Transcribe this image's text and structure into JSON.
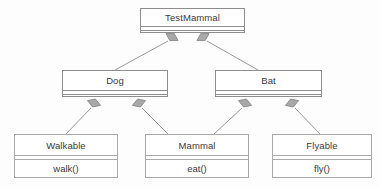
{
  "diagram": {
    "type": "uml-class-diagram",
    "background_color": "#fdfdfd",
    "line_color": "#9a9a9a",
    "border_color": "#8d8d8d",
    "text_color": "#3a3a3a",
    "diamond_fill": "#a8a8a8",
    "diamond_stroke": "#8a8a8a"
  },
  "classes": [
    {
      "id": "testmammal",
      "name": "TestMammal",
      "members": [],
      "x": 140,
      "y": 8,
      "width": 105,
      "height": 25,
      "name_height": 17,
      "has_empty_compartment": true,
      "style": "dark"
    },
    {
      "id": "dog",
      "name": "Dog",
      "members": [],
      "x": 62,
      "y": 70,
      "width": 106,
      "height": 27,
      "name_height": 19,
      "has_empty_compartment": true,
      "style": "dark"
    },
    {
      "id": "bat",
      "name": "Bat",
      "members": [],
      "x": 215,
      "y": 70,
      "width": 107,
      "height": 27,
      "name_height": 19,
      "has_empty_compartment": true,
      "style": "dark"
    },
    {
      "id": "walkable",
      "name": "Walkable",
      "members": [
        "walk()"
      ],
      "x": 14,
      "y": 134,
      "width": 104,
      "height": 44,
      "name_height": 20,
      "has_empty_compartment": false,
      "style": "light"
    },
    {
      "id": "mammal",
      "name": "Mammal",
      "members": [
        "eat()"
      ],
      "x": 145,
      "y": 134,
      "width": 104,
      "height": 44,
      "name_height": 20,
      "has_empty_compartment": false,
      "style": "light"
    },
    {
      "id": "flyable",
      "name": "Flyable",
      "members": [
        "fly()"
      ],
      "x": 272,
      "y": 134,
      "width": 100,
      "height": 44,
      "name_height": 20,
      "has_empty_compartment": false,
      "style": "light"
    },
    {
      "id": "testmammal-shadow",
      "name": "",
      "members": [],
      "x": 0,
      "y": 0,
      "width": 0,
      "height": 0,
      "name_height": 0,
      "has_empty_compartment": false,
      "style": "hidden"
    }
  ],
  "relationships": [
    {
      "id": "testmammal-dog",
      "type": "aggregation",
      "from": "TestMammal",
      "to": "Dog",
      "diamond": {
        "cx": 172,
        "cy": 37,
        "angle": 210
      },
      "line": {
        "x1": 168,
        "y1": 41,
        "x2": 115,
        "y2": 70
      }
    },
    {
      "id": "testmammal-bat",
      "type": "aggregation",
      "from": "TestMammal",
      "to": "Bat",
      "diamond": {
        "cx": 203,
        "cy": 37,
        "angle": 330
      },
      "line": {
        "x1": 207,
        "y1": 41,
        "x2": 258,
        "y2": 70
      }
    },
    {
      "id": "dog-walkable",
      "type": "aggregation",
      "from": "Dog",
      "to": "Walkable",
      "diamond": {
        "cx": 94,
        "cy": 103,
        "angle": 200
      },
      "line": {
        "x1": 91,
        "y1": 108,
        "x2": 66,
        "y2": 134
      }
    },
    {
      "id": "dog-mammal",
      "type": "aggregation",
      "from": "Dog",
      "to": "Mammal",
      "diamond": {
        "cx": 139,
        "cy": 103,
        "angle": 340
      },
      "line": {
        "x1": 142,
        "y1": 108,
        "x2": 168,
        "y2": 134
      }
    },
    {
      "id": "bat-mammal",
      "type": "aggregation",
      "from": "Bat",
      "to": "Mammal",
      "diamond": {
        "cx": 245,
        "cy": 103,
        "angle": 200
      },
      "line": {
        "x1": 242,
        "y1": 108,
        "x2": 214,
        "y2": 134
      }
    },
    {
      "id": "bat-flyable",
      "type": "aggregation",
      "from": "Bat",
      "to": "Flyable",
      "diamond": {
        "cx": 292,
        "cy": 103,
        "angle": 340
      },
      "line": {
        "x1": 295,
        "y1": 108,
        "x2": 320,
        "y2": 134
      }
    }
  ]
}
